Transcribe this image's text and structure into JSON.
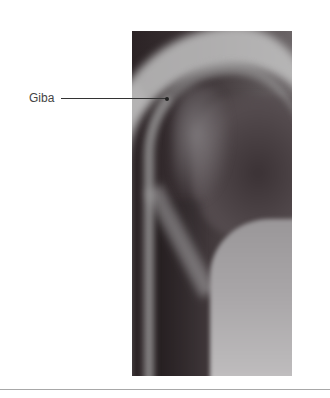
{
  "figure": {
    "image": {
      "description": "Lateral chest/spine X-ray radiograph showing a hump (kyphosis)",
      "icon": "xray-image"
    },
    "annotations": [
      {
        "label": "Giba",
        "pointer": "leader-line-to-hump"
      }
    ]
  }
}
